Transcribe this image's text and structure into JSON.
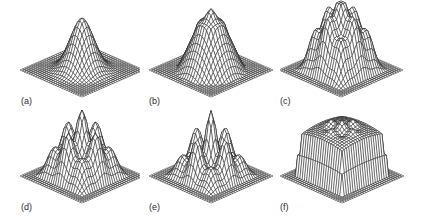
{
  "figure": {
    "panels": [
      {
        "id": "a",
        "label": "(a)",
        "shape": "single_peak",
        "description": "broad single peak"
      },
      {
        "id": "b",
        "label": "(b)",
        "shape": "peak_with_ring",
        "description": "single peak with emerging ring of bumps"
      },
      {
        "id": "c",
        "label": "(c)",
        "shape": "four_peaks_center",
        "description": "central peak with four surrounding peaks"
      },
      {
        "id": "d",
        "label": "(d)",
        "shape": "four_peaks_center_separated",
        "description": "central peak with four separated peaks"
      },
      {
        "id": "e",
        "label": "(e)",
        "shape": "four_peaks_center_sharp",
        "description": "sharper central peak with four surrounding peaks"
      },
      {
        "id": "f",
        "label": "(f)",
        "shape": "plateau",
        "description": "flat-topped plateau with small peaks"
      }
    ],
    "style": {
      "line_color": "#1e1e1e",
      "fill_color": "#ffffff",
      "label_color": "#2a2a2a",
      "background": "#ffffff"
    }
  }
}
